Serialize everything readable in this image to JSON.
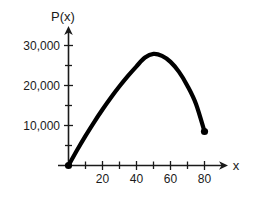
{
  "chart_data": {
    "type": "line",
    "title": "",
    "xlabel": "x",
    "ylabel": "P(x)",
    "xlim": [
      -3,
      88
    ],
    "ylim": [
      -3000,
      33000
    ],
    "grid": false,
    "legend": null,
    "x_ticks_major": [
      20,
      40,
      60,
      80
    ],
    "x_tick_labels": [
      "20",
      "40",
      "60",
      "80"
    ],
    "x_ticks_minor": [
      10,
      30,
      50,
      70
    ],
    "y_ticks_major": [
      10000,
      20000,
      30000
    ],
    "y_tick_labels": [
      "10,000",
      "20,000",
      "30,000"
    ],
    "y_ticks_minor": [
      5000,
      15000,
      25000
    ],
    "series": [
      {
        "name": "P(x)",
        "x": [
          0,
          5,
          10,
          15,
          20,
          25,
          30,
          35,
          40,
          45,
          50,
          55,
          60,
          65,
          70,
          75,
          80
        ],
        "values": [
          0,
          3800,
          7400,
          10800,
          14000,
          17000,
          19800,
          22400,
          24800,
          27000,
          27900,
          27400,
          25900,
          23400,
          19900,
          15400,
          8500
        ]
      }
    ],
    "markers": [
      {
        "name": "start-point",
        "x": 0,
        "y": 0,
        "style": "filled-circle"
      },
      {
        "name": "end-point",
        "x": 80,
        "y": 8500,
        "style": "filled-circle"
      }
    ],
    "colors": {
      "curve": "#000000",
      "axis": "#1a1a1a",
      "background": "#ffffff"
    }
  },
  "labels": {
    "y_axis_title": "P(x)",
    "x_axis_title": "x"
  }
}
